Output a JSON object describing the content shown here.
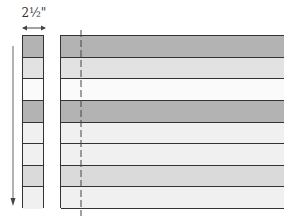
{
  "diagram": {
    "measurement_label": "2½\"",
    "strip_rows": [
      {
        "fill": "#b3b3b3"
      },
      {
        "fill": "#e2e2e2"
      },
      {
        "fill": "#fafafa"
      },
      {
        "fill": "#b3b3b3"
      },
      {
        "fill": "#f0f0f0"
      },
      {
        "fill": "#f0f0f0"
      },
      {
        "fill": "#dadada"
      },
      {
        "fill": "#f0f0f0"
      }
    ],
    "colors": {
      "line": "#333333",
      "arrow": "#555555"
    }
  }
}
